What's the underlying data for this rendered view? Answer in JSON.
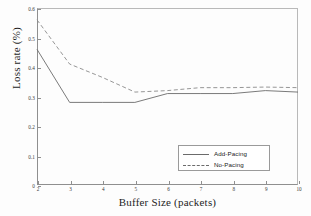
{
  "chart_data": {
    "type": "line",
    "title": "",
    "xlabel": "Buffer Size (packets)",
    "ylabel": "Loss rate (%)",
    "xlim": [
      2,
      10
    ],
    "ylim": [
      0,
      0.6
    ],
    "xticks": [
      "2",
      "3",
      "4",
      "5",
      "6",
      "7",
      "8",
      "9",
      "10"
    ],
    "yticks": [
      "0",
      "0.1",
      "0.2",
      "0.3",
      "0.4",
      "0.5",
      "0.6"
    ],
    "grid": false,
    "legend_position": "lower-right",
    "x": [
      2,
      3,
      4,
      5,
      6,
      7,
      8,
      9,
      10
    ],
    "series": [
      {
        "name": "Add-Pacing",
        "style": "solid",
        "color": "#6b6b6b",
        "values": [
          0.46,
          0.28,
          0.28,
          0.28,
          0.31,
          0.31,
          0.31,
          0.32,
          0.315
        ]
      },
      {
        "name": "No-Pacing",
        "style": "dashed",
        "color": "#8a8a8a",
        "values": [
          0.56,
          0.41,
          0.365,
          0.315,
          0.32,
          0.33,
          0.33,
          0.332,
          0.33
        ]
      }
    ]
  },
  "legend": {
    "items": [
      {
        "label": "Add-Pacing",
        "style": "solid"
      },
      {
        "label": "No-Pacing",
        "style": "dashed"
      }
    ]
  }
}
